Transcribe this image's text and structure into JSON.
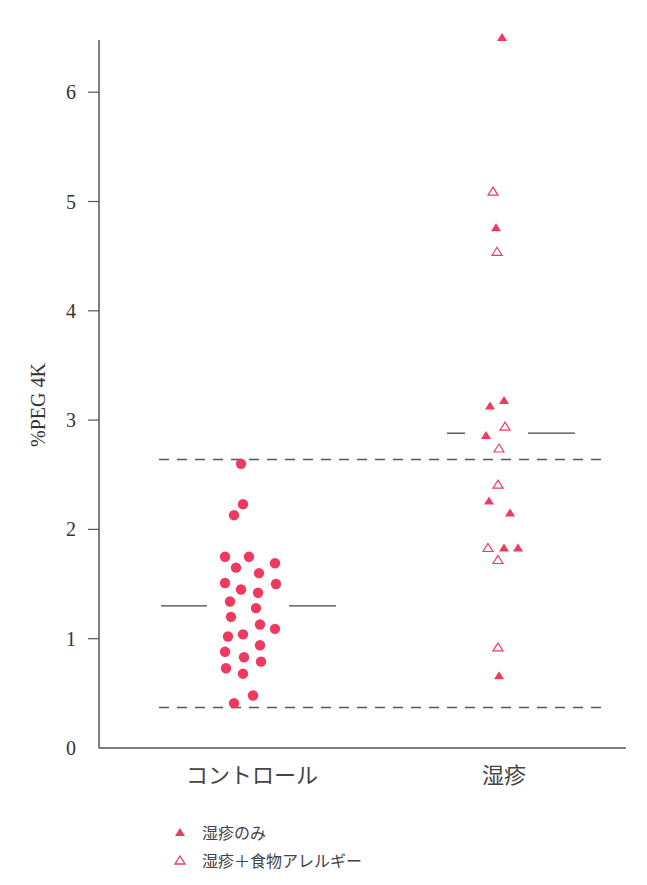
{
  "chart_data": {
    "type": "scatter",
    "title": "",
    "xlabel": "",
    "ylabel": "%PEG 4K",
    "ylim": [
      0,
      6.6
    ],
    "yticks": [
      0,
      1,
      2,
      3,
      4,
      5,
      6
    ],
    "grid": false,
    "categories": [
      "コントロール",
      "湿疹"
    ],
    "colors": {
      "marker": "#EE3A5E",
      "axis": "#555555",
      "dashed": "#555555"
    },
    "reference_lines": [
      {
        "type": "dashed",
        "y": 2.64,
        "label": "upper reference"
      },
      {
        "type": "dashed",
        "y": 0.37,
        "label": "lower reference"
      }
    ],
    "medians": [
      {
        "category": "コントロール",
        "y": 1.3
      },
      {
        "category": "湿疹",
        "y": 2.88
      }
    ],
    "series": [
      {
        "name": "コントロール",
        "marker": "filled-circle",
        "category": "コントロール",
        "points": [
          {
            "x": 241,
            "y": 2.6
          },
          {
            "x": 243,
            "y": 2.23
          },
          {
            "x": 234,
            "y": 2.13
          },
          {
            "x": 225,
            "y": 1.75
          },
          {
            "x": 249,
            "y": 1.75
          },
          {
            "x": 275,
            "y": 1.69
          },
          {
            "x": 236,
            "y": 1.65
          },
          {
            "x": 259,
            "y": 1.6
          },
          {
            "x": 225,
            "y": 1.51
          },
          {
            "x": 276,
            "y": 1.5
          },
          {
            "x": 241,
            "y": 1.45
          },
          {
            "x": 258,
            "y": 1.42
          },
          {
            "x": 230,
            "y": 1.34
          },
          {
            "x": 256,
            "y": 1.28
          },
          {
            "x": 231,
            "y": 1.2
          },
          {
            "x": 260,
            "y": 1.13
          },
          {
            "x": 275,
            "y": 1.09
          },
          {
            "x": 243,
            "y": 1.04
          },
          {
            "x": 228,
            "y": 1.02
          },
          {
            "x": 260,
            "y": 0.94
          },
          {
            "x": 225,
            "y": 0.88
          },
          {
            "x": 244,
            "y": 0.83
          },
          {
            "x": 261,
            "y": 0.79
          },
          {
            "x": 226,
            "y": 0.73
          },
          {
            "x": 243,
            "y": 0.68
          },
          {
            "x": 253,
            "y": 0.48
          },
          {
            "x": 234,
            "y": 0.41
          }
        ]
      },
      {
        "name": "湿疹のみ",
        "marker": "filled-triangle",
        "category": "湿疹",
        "points": [
          {
            "x": 502,
            "y": 6.5
          },
          {
            "x": 496,
            "y": 4.76
          },
          {
            "x": 504,
            "y": 3.18
          },
          {
            "x": 490,
            "y": 3.13
          },
          {
            "x": 486,
            "y": 2.86
          },
          {
            "x": 489,
            "y": 2.26
          },
          {
            "x": 510,
            "y": 2.15
          },
          {
            "x": 504,
            "y": 1.83
          },
          {
            "x": 518,
            "y": 1.83
          },
          {
            "x": 499,
            "y": 0.66
          }
        ]
      },
      {
        "name": "湿疹＋食物アレルギー",
        "marker": "open-triangle",
        "category": "湿疹",
        "points": [
          {
            "x": 493,
            "y": 5.09
          },
          {
            "x": 497,
            "y": 4.54
          },
          {
            "x": 505,
            "y": 2.94
          },
          {
            "x": 499,
            "y": 2.74
          },
          {
            "x": 498,
            "y": 2.41
          },
          {
            "x": 488,
            "y": 1.83
          },
          {
            "x": 498,
            "y": 1.72
          },
          {
            "x": 498,
            "y": 0.92
          }
        ]
      }
    ],
    "legend": {
      "position": "bottom-left",
      "entries": [
        {
          "label": "湿疹のみ",
          "marker": "filled-triangle"
        },
        {
          "label": "湿疹＋食物アレルギー",
          "marker": "open-triangle"
        }
      ]
    }
  }
}
